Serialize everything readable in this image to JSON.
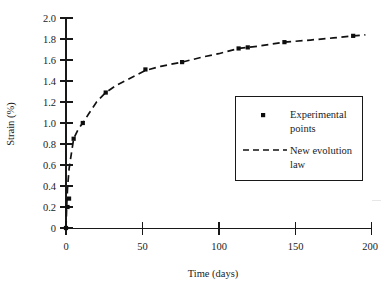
{
  "chart_data": {
    "type": "line",
    "title": "",
    "xlabel": "Time (days)",
    "ylabel": "Strain (%)",
    "xlim": [
      0,
      200
    ],
    "ylim": [
      0,
      2.0
    ],
    "xticks": [
      "0",
      "50",
      "100",
      "150",
      "200"
    ],
    "xtick_values": [
      0,
      50,
      100,
      150,
      200
    ],
    "yticks": [
      "0",
      "0.2",
      "0.4",
      "0.6",
      "0.8",
      "1.0",
      "1.2",
      "1.4",
      "1.6",
      "1.8",
      "2.0"
    ],
    "ytick_values": [
      0,
      0.2,
      0.4,
      0.6,
      0.8,
      1.0,
      1.2,
      1.4,
      1.6,
      1.8,
      2.0
    ],
    "grid": false,
    "legend_position": "center-right",
    "series": [
      {
        "name": "Experimental points",
        "marker": "square",
        "style": "markers",
        "x": [
          0,
          1,
          2,
          5,
          11,
          26,
          52,
          76,
          113,
          119,
          143,
          188
        ],
        "y": [
          0.0,
          0.2,
          0.28,
          0.85,
          1.0,
          1.29,
          1.51,
          1.58,
          1.71,
          1.72,
          1.77,
          1.83
        ]
      },
      {
        "name": "New evolution law",
        "style": "dashed-line",
        "x": [
          0,
          0.5,
          1,
          2,
          3,
          5,
          8,
          11,
          15,
          20,
          26,
          33,
          40,
          52,
          62,
          76,
          90,
          100,
          113,
          125,
          143,
          160,
          175,
          188,
          196
        ],
        "y": [
          0.0,
          0.22,
          0.38,
          0.56,
          0.66,
          0.85,
          0.94,
          1.0,
          1.09,
          1.2,
          1.29,
          1.36,
          1.41,
          1.5,
          1.54,
          1.58,
          1.63,
          1.66,
          1.71,
          1.73,
          1.77,
          1.79,
          1.81,
          1.83,
          1.84
        ]
      }
    ]
  },
  "legend": {
    "entries": [
      {
        "label_line1": "Experimental",
        "label_line2": "points",
        "icon": "square-marker-icon"
      },
      {
        "label_line1": "New evolution",
        "label_line2": "law",
        "icon": "dashed-line-icon"
      }
    ]
  },
  "colors": {
    "ink": "#181818",
    "curve": "#111111",
    "marker": "#0d0d0d",
    "background": "#ffffff"
  }
}
